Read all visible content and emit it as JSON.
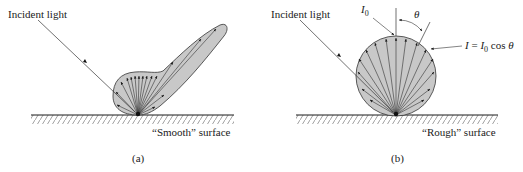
{
  "panels": [
    {
      "id": "a",
      "caption": "(a)",
      "incident_label": "Incident light",
      "surface_label": "“Smooth” surface",
      "reflection_type": "specular-lobe"
    },
    {
      "id": "b",
      "caption": "(b)",
      "incident_label": "Incident light",
      "surface_label": "“Rough” surface",
      "reflection_type": "lambertian-circle",
      "i0_label": "I",
      "i0_sub": "0",
      "theta_label": "θ",
      "formula": {
        "lhs": "I",
        "eq": " = ",
        "i": "I",
        "sub": "0",
        "rest": " cos ",
        "theta": "θ"
      }
    }
  ],
  "colors": {
    "fill": "#c8c8c8",
    "stroke": "#1a1a1a",
    "hatch": "#777777"
  }
}
